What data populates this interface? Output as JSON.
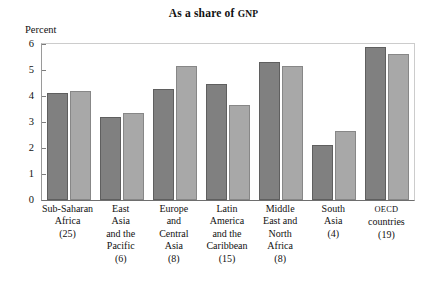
{
  "chart_data": {
    "type": "bar",
    "title": "As a share of GNP",
    "title_main": "As a share of ",
    "title_smallcaps": "GNP",
    "xlabel": "",
    "ylabel": "Percent",
    "ylim": [
      0,
      6
    ],
    "yticks": [
      6,
      5,
      4,
      3,
      2,
      1,
      0
    ],
    "grid": false,
    "legend": "none",
    "categories": [
      "Sub-Saharan Africa (25)",
      "East Asia and the Pacific (6)",
      "Europe and Central Asia (8)",
      "Latin America and the Caribbean (15)",
      "Middle East and North Africa (8)",
      "South Asia (4)",
      "OECD countries (19)"
    ],
    "category_lines": [
      [
        "Sub-Saharan",
        "Africa",
        "(25)"
      ],
      [
        "East",
        "Asia",
        "and the",
        "Pacific",
        "(6)"
      ],
      [
        "Europe",
        "and",
        "Central",
        "Asia",
        "(8)"
      ],
      [
        "Latin",
        "America",
        "and the",
        "Caribbean",
        "(15)"
      ],
      [
        "Middle",
        "East and",
        "North",
        "Africa",
        "(8)"
      ],
      [
        "South",
        "Asia",
        "(4)"
      ],
      [
        "OECD",
        "countries",
        "(19)"
      ]
    ],
    "category_smallcaps_index": 6,
    "series": [
      {
        "name": "series-1",
        "color": "#808080",
        "values": [
          4.1,
          3.2,
          4.25,
          4.45,
          5.3,
          2.1,
          5.9
        ]
      },
      {
        "name": "series-2",
        "color": "#a8a8a8",
        "values": [
          4.2,
          3.35,
          5.15,
          3.65,
          5.15,
          2.65,
          5.6
        ]
      }
    ]
  }
}
